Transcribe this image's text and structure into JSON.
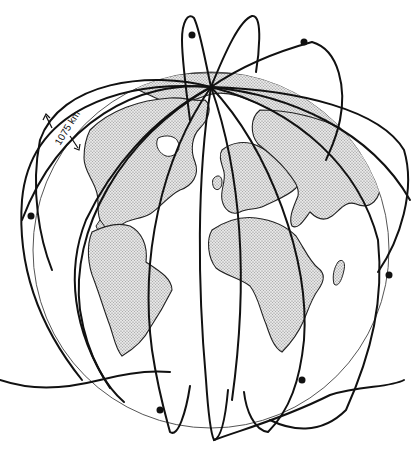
{
  "figure": {
    "type": "satellite-constellation-illustration",
    "annotation": {
      "altitude_label": "1075 km"
    },
    "satellite_count_visible": 8,
    "colors": {
      "ink": "#111111",
      "land_fill": "#d4d4d4",
      "globe_outline": "#555555",
      "background": "#ffffff"
    }
  }
}
